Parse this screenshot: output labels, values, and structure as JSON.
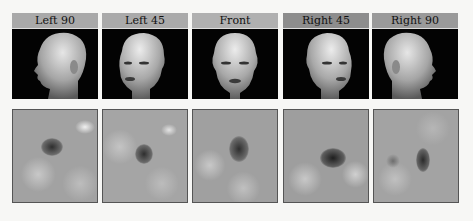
{
  "figure": {
    "views": [
      {
        "label": "Left 90",
        "label_bg": "#a9a9a9",
        "view": "left-profile"
      },
      {
        "label": "Left 45",
        "label_bg": "#aaaaaa",
        "view": "left-three-quarter"
      },
      {
        "label": "Front",
        "label_bg": "#b0b0b0",
        "view": "frontal"
      },
      {
        "label": "Right 45",
        "label_bg": "#8d8d8d",
        "view": "right-three-quarter"
      },
      {
        "label": "Right 90",
        "label_bg": "#9a9a9a",
        "view": "right-profile"
      }
    ],
    "rows": [
      "mannequin head photographs",
      "grayscale noise classification images with dark spot"
    ]
  }
}
